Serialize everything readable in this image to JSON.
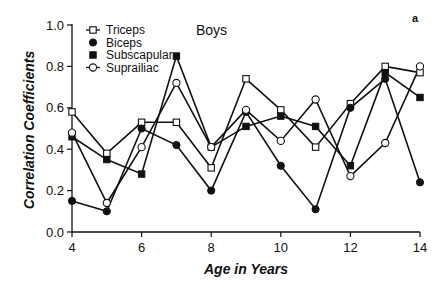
{
  "chart_data": {
    "type": "line",
    "title": "Boys",
    "panel_label": "a",
    "xlabel": "Age in Years",
    "ylabel": "Correlation Coefficients",
    "x": [
      4,
      5,
      6,
      7,
      8,
      9,
      10,
      11,
      12,
      13,
      14
    ],
    "xlim": [
      4,
      14
    ],
    "ylim": [
      0.0,
      1.0
    ],
    "x_ticks": [
      4,
      6,
      8,
      10,
      12,
      14
    ],
    "x_tick_labels": [
      "4",
      "6",
      "8",
      "10",
      "12",
      "14"
    ],
    "y_ticks": [
      0.0,
      0.2,
      0.4,
      0.6,
      0.8,
      1.0
    ],
    "y_tick_labels": [
      "0.0",
      "0.2",
      "0.4",
      "0.6",
      "0.8",
      "1.0"
    ],
    "grid": false,
    "legend_position": "upper left",
    "series": [
      {
        "name": "Triceps",
        "marker": "open-square",
        "values": [
          0.58,
          0.38,
          0.53,
          0.53,
          0.31,
          0.74,
          0.59,
          0.41,
          0.62,
          0.8,
          0.77
        ]
      },
      {
        "name": "Biceps",
        "marker": "filled-circle",
        "values": [
          0.15,
          0.1,
          0.5,
          0.42,
          0.2,
          0.58,
          0.32,
          0.11,
          0.6,
          0.74,
          0.24
        ]
      },
      {
        "name": "Subscapular",
        "marker": "filled-square",
        "values": [
          0.46,
          0.35,
          0.28,
          0.85,
          0.41,
          0.51,
          0.56,
          0.51,
          0.32,
          0.77,
          0.65
        ]
      },
      {
        "name": "Suprailiac",
        "marker": "open-circle",
        "values": [
          0.48,
          0.14,
          0.41,
          0.72,
          0.41,
          0.59,
          0.44,
          0.64,
          0.27,
          0.43,
          0.8
        ]
      }
    ]
  },
  "colors": {
    "line": "#111111",
    "background": "#ffffff"
  }
}
